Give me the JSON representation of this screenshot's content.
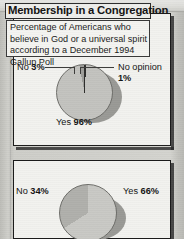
{
  "graphic": {
    "panels": [
      {
        "id": "belief",
        "title": "Belief in God",
        "subtitle": "Percentage of Americans who believe in God or a universal spirit according to a December 1994 Gallup Poll",
        "labels": {
          "no": "No ",
          "no_value": "3%",
          "no_opinion": "No opinion ",
          "no_opinion_value": "1%",
          "yes": "Yes ",
          "yes_value": "96%"
        }
      },
      {
        "id": "membership",
        "title": "Membership in a Congregation",
        "labels": {
          "no": "No ",
          "no_value": "34%",
          "yes": "Yes ",
          "yes_value": "66%"
        }
      }
    ]
  },
  "chart_data": [
    {
      "type": "pie",
      "title": "Belief in God",
      "subtitle": "Percentage of Americans who believe in God or a universal spirit according to a December 1994 Gallup Poll",
      "categories": [
        "Yes",
        "No",
        "No opinion"
      ],
      "values": [
        96,
        3,
        1
      ],
      "labels": [
        "Yes 96%",
        "No 3%",
        "No opinion 1%"
      ],
      "unit": "percent",
      "legend": "inline-callouts",
      "colors": [
        "#c3c3bf",
        "#9e9e9a",
        "#2e2e2c"
      ]
    },
    {
      "type": "pie",
      "title": "Membership in a Congregation",
      "categories": [
        "Yes",
        "No"
      ],
      "values": [
        66,
        34
      ],
      "labels": [
        "Yes 66%",
        "No 34%"
      ],
      "unit": "percent",
      "legend": "inline-callouts",
      "colors": [
        "#b0b0ac",
        "#c9c9c5"
      ]
    }
  ],
  "colors": {
    "page_background": "#c9c9c5",
    "panel_background": "#f2f2ef",
    "border": "#1b1b1b",
    "text": "#141414",
    "pie_light": "#c3c3bf",
    "pie_dark": "#9e9e9a",
    "pie_sliver": "#2e2e2c",
    "shadow": "#9a9a96"
  }
}
